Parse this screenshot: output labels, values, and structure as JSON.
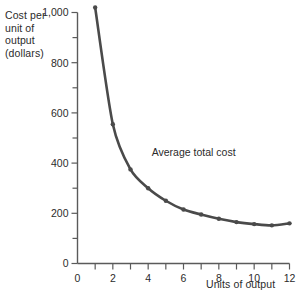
{
  "chart_data": {
    "type": "line",
    "title": "",
    "ylabel_lines": [
      "Cost per",
      "unit of",
      "output",
      "(dollars)"
    ],
    "ylabel": "Cost per unit of output (dollars)",
    "xlabel": "Units of output",
    "x": [
      1,
      2,
      3,
      4,
      5,
      6,
      7,
      8,
      9,
      10,
      11,
      12
    ],
    "series": [
      {
        "name": "Average total cost",
        "values": [
          1020,
          555,
          375,
          300,
          250,
          215,
          195,
          178,
          165,
          157,
          152,
          160
        ]
      }
    ],
    "annotations": [
      {
        "text": "Average total cost",
        "x": 4.2,
        "y": 430
      }
    ],
    "xlim": [
      0,
      12
    ],
    "ylim": [
      0,
      1000
    ],
    "xticks": [
      1,
      2,
      3,
      4,
      5,
      6,
      7,
      8,
      9,
      10,
      11,
      12
    ],
    "xtick_labels": [
      "0",
      "2",
      "4",
      "6",
      "8",
      "10",
      "12"
    ],
    "xtick_label_values": [
      0,
      2,
      4,
      6,
      8,
      10,
      12
    ],
    "yticks": [
      0,
      100,
      200,
      300,
      400,
      500,
      600,
      700,
      800,
      900,
      1000
    ],
    "ytick_labels": [
      "0",
      "200",
      "400",
      "600",
      "800",
      "1,000"
    ],
    "ytick_label_values": [
      0,
      200,
      400,
      600,
      800,
      1000
    ],
    "grid": false,
    "legend": "none",
    "line_color": "#4a4a4a",
    "marker": "circle",
    "axis_color": "#5a5a5a"
  }
}
